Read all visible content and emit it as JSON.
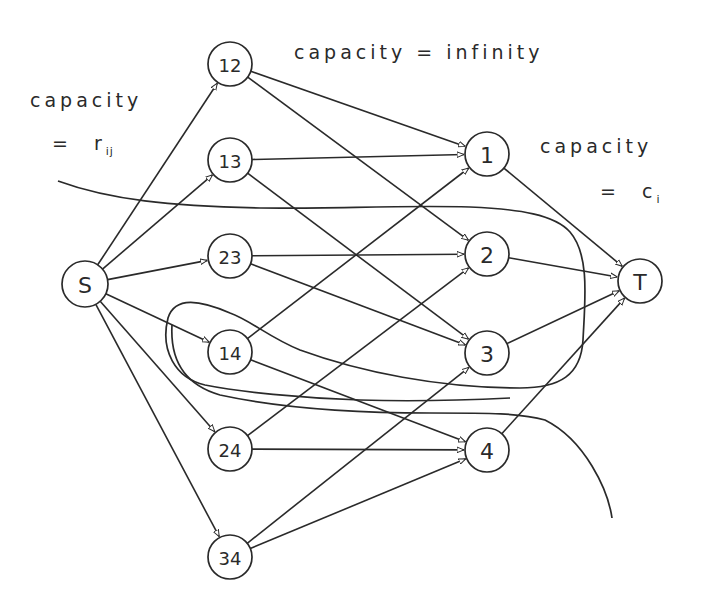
{
  "diagram": {
    "type": "flow-network",
    "labels": {
      "source_capacity_line1": "capacity",
      "source_capacity_line2_eq": "=",
      "source_capacity_var": "r",
      "source_capacity_sub": "ij",
      "middle_capacity": "capacity = infinity",
      "sink_capacity_line1": "capacity",
      "sink_capacity_line2_eq": "=",
      "sink_capacity_var": "c",
      "sink_capacity_sub": "i"
    },
    "nodes": [
      {
        "id": "S",
        "label": "S",
        "x": 85,
        "y": 284,
        "r": 23,
        "kind": "source"
      },
      {
        "id": "12",
        "label": "12",
        "x": 230,
        "y": 64,
        "r": 22,
        "kind": "pair"
      },
      {
        "id": "13",
        "label": "13",
        "x": 230,
        "y": 160,
        "r": 22,
        "kind": "pair"
      },
      {
        "id": "23",
        "label": "23",
        "x": 230,
        "y": 256,
        "r": 22,
        "kind": "pair"
      },
      {
        "id": "14",
        "label": "14",
        "x": 230,
        "y": 352,
        "r": 22,
        "kind": "pair"
      },
      {
        "id": "24",
        "label": "24",
        "x": 230,
        "y": 449,
        "r": 22,
        "kind": "pair"
      },
      {
        "id": "34",
        "label": "34",
        "x": 230,
        "y": 557,
        "r": 22,
        "kind": "pair"
      },
      {
        "id": "1",
        "label": "1",
        "x": 487,
        "y": 154,
        "r": 22,
        "kind": "item"
      },
      {
        "id": "2",
        "label": "2",
        "x": 487,
        "y": 254,
        "r": 22,
        "kind": "item"
      },
      {
        "id": "3",
        "label": "3",
        "x": 487,
        "y": 353,
        "r": 22,
        "kind": "item"
      },
      {
        "id": "4",
        "label": "4",
        "x": 487,
        "y": 450,
        "r": 22,
        "kind": "item"
      },
      {
        "id": "T",
        "label": "T",
        "x": 640,
        "y": 281,
        "r": 22,
        "kind": "sink"
      }
    ],
    "edges": [
      {
        "from": "S",
        "to": "12"
      },
      {
        "from": "S",
        "to": "13"
      },
      {
        "from": "S",
        "to": "23"
      },
      {
        "from": "S",
        "to": "14"
      },
      {
        "from": "S",
        "to": "24"
      },
      {
        "from": "S",
        "to": "34"
      },
      {
        "from": "12",
        "to": "1"
      },
      {
        "from": "12",
        "to": "2"
      },
      {
        "from": "13",
        "to": "1"
      },
      {
        "from": "13",
        "to": "3"
      },
      {
        "from": "23",
        "to": "2"
      },
      {
        "from": "23",
        "to": "3"
      },
      {
        "from": "14",
        "to": "1"
      },
      {
        "from": "14",
        "to": "4"
      },
      {
        "from": "24",
        "to": "2"
      },
      {
        "from": "24",
        "to": "4"
      },
      {
        "from": "34",
        "to": "3"
      },
      {
        "from": "34",
        "to": "4"
      },
      {
        "from": "1",
        "to": "T"
      },
      {
        "from": "2",
        "to": "T"
      },
      {
        "from": "3",
        "to": "T"
      },
      {
        "from": "4",
        "to": "T"
      }
    ],
    "cuts": [
      {
        "name": "cut-curve-upper",
        "path": "M58,181 C110,200 170,206 260,208 C330,209 400,205 470,207 C520,209 555,215 570,232 C590,255 585,300 583,340 C581,375 560,388 520,388 C440,388 360,372 300,350 C270,338 250,320 230,313 C200,300 175,296 168,318 C160,350 175,378 205,385 C240,392 300,398 360,400 C420,402 470,400 510,398"
      },
      {
        "name": "cut-curve-lower",
        "path": "M172,325 C170,360 185,385 220,395 C280,408 360,413 430,413 C490,413 520,413 545,420 C585,440 608,490 612,518"
      }
    ]
  }
}
